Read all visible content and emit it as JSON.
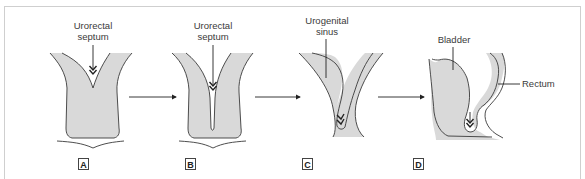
{
  "figure": {
    "colors": {
      "tissue_fill": "#d9d9d9",
      "outline": "#3a3a3a",
      "frame": "#cfcfcf",
      "text": "#3a3a3a"
    },
    "panels": [
      {
        "id": "A",
        "letter": "A",
        "labels": [
          "Urorectal septum"
        ]
      },
      {
        "id": "B",
        "letter": "B",
        "labels": [
          "Urorectal septum"
        ]
      },
      {
        "id": "C",
        "letter": "C",
        "labels": [
          "Urogenital sinus"
        ]
      },
      {
        "id": "D",
        "letter": "D",
        "labels": [
          "Bladder",
          "Rectum"
        ]
      }
    ],
    "labels": {
      "a_line1": "Urorectal",
      "a_line2": "septum",
      "b_line1": "Urorectal",
      "b_line2": "septum",
      "c_line1": "Urogenital",
      "c_line2": "sinus",
      "d_bladder": "Bladder",
      "d_rectum": "Rectum"
    },
    "arrows": [
      "A→B",
      "B→C",
      "C→D"
    ]
  }
}
